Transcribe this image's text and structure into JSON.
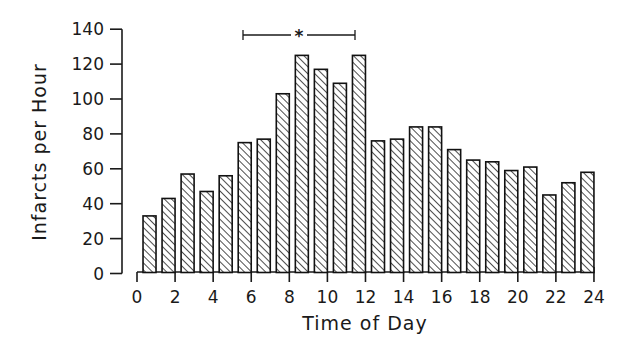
{
  "chart_data": {
    "type": "bar",
    "title": "",
    "xlabel": "Time of Day",
    "ylabel": "Infarcts per Hour",
    "xlim": [
      0,
      24
    ],
    "ylim": [
      0,
      140
    ],
    "x_ticks": [
      0,
      2,
      4,
      6,
      8,
      10,
      12,
      14,
      16,
      18,
      20,
      22,
      24
    ],
    "y_ticks": [
      0,
      20,
      40,
      60,
      80,
      100,
      120,
      140
    ],
    "grid": false,
    "legend": null,
    "bar_fill": "diagonal-hatch",
    "categories": [
      "0-1",
      "1-2",
      "2-3",
      "3-4",
      "4-5",
      "5-6",
      "6-7",
      "7-8",
      "8-9",
      "9-10",
      "10-11",
      "11-12",
      "12-13",
      "13-14",
      "14-15",
      "15-16",
      "16-17",
      "17-18",
      "18-19",
      "19-20",
      "20-21",
      "21-22",
      "22-23",
      "23-24"
    ],
    "values": [
      33,
      43,
      57,
      47,
      56,
      75,
      77,
      103,
      125,
      117,
      109,
      125,
      76,
      77,
      84,
      84,
      71,
      65,
      64,
      59,
      61,
      45,
      52,
      58
    ],
    "annotations": [
      {
        "type": "significance-bracket",
        "x_start": 5.5,
        "x_end": 11.5,
        "y": 135,
        "label": "*"
      }
    ]
  }
}
